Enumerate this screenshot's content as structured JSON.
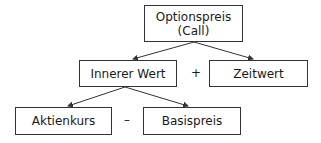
{
  "diagram": {
    "nodes": {
      "root": {
        "line1": "Optionspreis",
        "line2": "(Call)"
      },
      "intrinsic": {
        "label": "Innerer Wert"
      },
      "time_value": {
        "label": "Zeitwert"
      },
      "stock_price": {
        "label": "Aktienkurs"
      },
      "strike_price": {
        "label": "Basispreis"
      }
    },
    "operators": {
      "plus": "+",
      "minus": "–"
    },
    "edges": [
      {
        "from": "root",
        "to": "intrinsic"
      },
      {
        "from": "root",
        "to": "time_value"
      },
      {
        "from": "intrinsic",
        "to": "stock_price"
      },
      {
        "from": "intrinsic",
        "to": "strike_price"
      }
    ],
    "colors": {
      "line": "#333333",
      "text": "#1a1a1a",
      "background": "#ffffff"
    }
  }
}
